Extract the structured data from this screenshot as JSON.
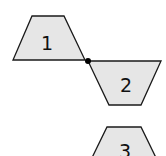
{
  "diagram": {
    "type": "trapezoid-reflection-sequence",
    "colors": {
      "fill": "#e6e6e6",
      "stroke": "#1a1a1a",
      "pivot": "#000000",
      "background": "#ffffff"
    },
    "shapes": [
      {
        "id": "1",
        "label": "1",
        "orientation": "upright",
        "points": "32,16 64,16 85,60 13,60",
        "label_pos": {
          "x": 47,
          "y": 50
        }
      },
      {
        "id": "2",
        "label": "2",
        "orientation": "inverted",
        "points": "88,61 161,61 141,105 109,105",
        "label_pos": {
          "x": 126,
          "y": 92
        }
      },
      {
        "id": "3",
        "label": "3",
        "orientation": "upright",
        "points": "107,127 141,127 162,170 86,170",
        "label_pos": {
          "x": 125,
          "y": 158
        }
      }
    ],
    "pivot_point": {
      "x": 88,
      "y": 61,
      "r": 3
    }
  }
}
